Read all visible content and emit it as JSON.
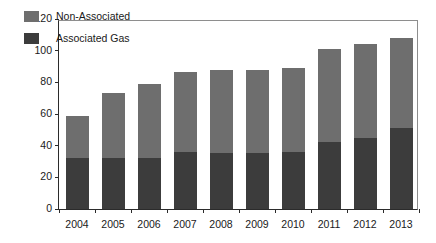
{
  "chart_data": {
    "type": "bar",
    "title": "",
    "subtitle": "",
    "xlabel": "",
    "ylabel": "Million cm/d",
    "stacked": true,
    "grid": false,
    "legend_position": "top-left-inside",
    "ylim": [
      0,
      120
    ],
    "yticks": [
      0,
      20,
      40,
      60,
      80,
      100,
      120
    ],
    "ytick_labels": [
      "0",
      "20",
      "40",
      "60",
      "80",
      "100",
      "120"
    ],
    "categories": [
      "2004",
      "2005",
      "2006",
      "2007",
      "2008",
      "2009",
      "2010",
      "2011",
      "2012",
      "2013"
    ],
    "series": [
      {
        "name": "Associated Gas",
        "color": "#3c3c3c",
        "values": [
          32.5,
          32.5,
          32,
          36,
          35.5,
          35.5,
          36,
          42.5,
          45,
          51
        ]
      },
      {
        "name": "Non-Associated",
        "color": "#6e6e6e",
        "values": [
          26,
          40.5,
          47,
          50.5,
          52,
          52,
          53,
          58.5,
          59,
          57
        ]
      }
    ],
    "totals": [
      58.5,
      73,
      79,
      86.5,
      87.5,
      87.5,
      89,
      101,
      104,
      108
    ]
  },
  "legend": {
    "items": [
      {
        "label": "Non-Associated",
        "color": "#6e6e6e"
      },
      {
        "label": "Associated Gas",
        "color": "#3c3c3c"
      }
    ]
  },
  "axes": {
    "y_title": "Million cm/d"
  }
}
